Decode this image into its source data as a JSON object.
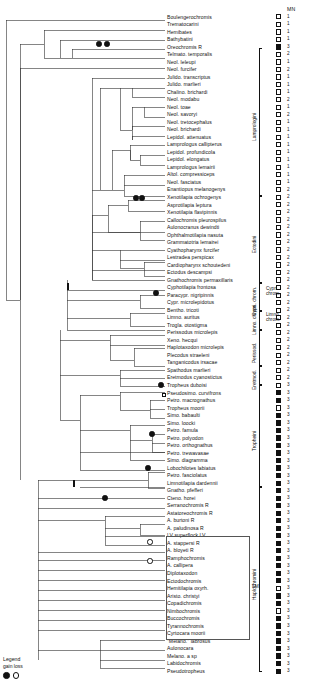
{
  "figure": {
    "title": "",
    "mn_header": "MN",
    "legend": {
      "title": "Legend",
      "subtitle": "gain loss",
      "symbols": [
        "gain-filled-circle",
        "loss-open-circle"
      ]
    },
    "lm_note": "LM"
  },
  "colors": {
    "line": "#111111",
    "fill_state": "#111111",
    "empty_state": "#ffffff",
    "box_outline": "#555555",
    "background": "#ffffff"
  },
  "group_brackets": [
    {
      "label": "Lamprologini",
      "top": 48,
      "bottom": 196
    },
    {
      "label": "Ectodini",
      "top": 196,
      "bottom": 283
    },
    {
      "label": "Cypri. chrom.",
      "top": 283,
      "bottom": 311
    },
    {
      "label": "Limno. chrom.",
      "top": 311,
      "bottom": 330
    },
    {
      "label": "Perissod.",
      "top": 330,
      "bottom": 366
    },
    {
      "label": "Eretmod.",
      "top": 366,
      "bottom": 385
    },
    {
      "label": "Tropheini",
      "top": 385,
      "bottom": 487
    },
    {
      "label": "Haplochromini",
      "top": 487,
      "bottom": 672
    }
  ],
  "taxa": [
    {
      "name": "Boulengerochromis",
      "state": "open",
      "code": "1"
    },
    {
      "name": "Trematocarini",
      "state": "open",
      "code": "1"
    },
    {
      "name": "Hemibates",
      "state": "open",
      "code": "1"
    },
    {
      "name": "Bathybatini",
      "state": "open",
      "code": "1"
    },
    {
      "name": "Oreochromis R",
      "state": "filled",
      "code": "3"
    },
    {
      "name": "Telmato. temporalis",
      "state": "open",
      "code": "2"
    },
    {
      "name": "Neol. leleupi",
      "state": "open",
      "code": "1"
    },
    {
      "name": "Neol. furcifer",
      "state": "open",
      "code": "2"
    },
    {
      "name": "Julido. transcriptus",
      "state": "open",
      "code": "1"
    },
    {
      "name": "Julido. marlieri",
      "state": "open",
      "code": "1"
    },
    {
      "name": "Chalino. brichardi",
      "state": "open",
      "code": "1"
    },
    {
      "name": "Neol. modabu",
      "state": "open",
      "code": "2"
    },
    {
      "name": "Neol. toae",
      "state": "open",
      "code": "1"
    },
    {
      "name": "Neol. savoryi",
      "state": "open",
      "code": "2"
    },
    {
      "name": "Neol. tretocephalus",
      "state": "open",
      "code": "1"
    },
    {
      "name": "Neol. brichardi",
      "state": "open",
      "code": "1"
    },
    {
      "name": "Lepidol. attenuatus",
      "state": "open",
      "code": "1"
    },
    {
      "name": "Lamprologus callipterus",
      "state": "open",
      "code": "1"
    },
    {
      "name": "Lepidol. profundicola",
      "state": "open",
      "code": "1"
    },
    {
      "name": "Lepidol. elongatus",
      "state": "open",
      "code": "1"
    },
    {
      "name": "Lamprologus lemairii",
      "state": "open",
      "code": "1"
    },
    {
      "name": "Altol. compressiceps",
      "state": "open",
      "code": "1"
    },
    {
      "name": "Neol. fasciatus",
      "state": "open",
      "code": "1"
    },
    {
      "name": "Enantiopus melanogenys",
      "state": "open",
      "code": "2"
    },
    {
      "name": "Xenotilapia ochrogenys",
      "state": "open",
      "code": "2"
    },
    {
      "name": "Asprotilapia leptura",
      "state": "open",
      "code": "2"
    },
    {
      "name": "Xenotilapia flavipinnis",
      "state": "open",
      "code": "2"
    },
    {
      "name": "Callochromis pleurospilus",
      "state": "open",
      "code": "2"
    },
    {
      "name": "Aulonocranus dewindti",
      "state": "open",
      "code": "2"
    },
    {
      "name": "Ophthalmotilapia nasuta",
      "state": "open",
      "code": "2"
    },
    {
      "name": "Grammatotria lemairei",
      "state": "open",
      "code": "2"
    },
    {
      "name": "Cyathopharynx furcifer",
      "state": "open",
      "code": "2"
    },
    {
      "name": "Lestradea perspicax",
      "state": "open",
      "code": "2"
    },
    {
      "name": "Cardiopharynx schoutedeni",
      "state": "open",
      "code": "2"
    },
    {
      "name": "Ectodus descampsi",
      "state": "open",
      "code": "2"
    },
    {
      "name": "Gnathochromis permaxillaris",
      "state": "open",
      "code": "2"
    },
    {
      "name": "Cyphotilapia frontosa",
      "state": "open",
      "code": "2"
    },
    {
      "name": "Paracypr. nigripinnis",
      "state": "open",
      "code": "2"
    },
    {
      "name": "Cypr. microlepidotus",
      "state": "open",
      "code": "2"
    },
    {
      "name": "Bentho. tricoti",
      "state": "open",
      "code": "2"
    },
    {
      "name": "Limno. auritus",
      "state": "open",
      "code": "2"
    },
    {
      "name": "Trogla. otostigma",
      "state": "open",
      "code": "2"
    },
    {
      "name": "Perissodus microlepis",
      "state": "open",
      "code": "2"
    },
    {
      "name": "Xeno. hecqui",
      "state": "open",
      "code": "2"
    },
    {
      "name": "Haplotaxodon microlepis",
      "state": "open",
      "code": "2"
    },
    {
      "name": "Plecodus straeleni",
      "state": "open",
      "code": "2"
    },
    {
      "name": "Tanganicodus irsacae",
      "state": "open",
      "code": "2"
    },
    {
      "name": "Spathodus marlieri",
      "state": "open",
      "code": "2"
    },
    {
      "name": "Eretmodus cyanostictus",
      "state": "open",
      "code": "2"
    },
    {
      "name": "Tropheus duboisi",
      "state": "open",
      "code": "3"
    },
    {
      "name": "Pseudosimo. curvifrons",
      "state": "filled",
      "code": "3"
    },
    {
      "name": "Petro. macrognathus",
      "state": "filled",
      "code": "3"
    },
    {
      "name": "Tropheus moorii",
      "state": "open",
      "code": "3"
    },
    {
      "name": "Simo. babaulti",
      "state": "filled",
      "code": "3"
    },
    {
      "name": "Simo. loocki",
      "state": "filled",
      "code": "3"
    },
    {
      "name": "Petro. famula",
      "state": "filled",
      "code": "3"
    },
    {
      "name": "Petro. polyodon",
      "state": "filled",
      "code": "3"
    },
    {
      "name": "Petro. orthognathus",
      "state": "filled",
      "code": "3"
    },
    {
      "name": "Petro. trewavasae",
      "state": "filled",
      "code": "3"
    },
    {
      "name": "Simo. diagramma",
      "state": "filled",
      "code": "3"
    },
    {
      "name": "Lobochilotes labiatus",
      "state": "filled",
      "code": "3"
    },
    {
      "name": "Petro. fasciolatus",
      "state": "filled",
      "code": "3"
    },
    {
      "name": "Limnotilapia dardennii",
      "state": "filled",
      "code": "3"
    },
    {
      "name": "Gnatho. pfefferi",
      "state": "filled",
      "code": "3"
    },
    {
      "name": "Cteno. horei",
      "state": "filled",
      "code": "3"
    },
    {
      "name": "Serranochromis R",
      "state": "filled",
      "code": "3"
    },
    {
      "name": "Astatoreochromis R",
      "state": "filled",
      "code": "3"
    },
    {
      "name": "A. burtoni R",
      "state": "filled",
      "code": "3"
    },
    {
      "name": "A. paludinosa R",
      "state": "filled",
      "code": "3"
    },
    {
      "name": "LV superflock LV",
      "state": "filled",
      "code": "3"
    },
    {
      "name": "A. stappersi R",
      "state": "filled",
      "code": "3"
    },
    {
      "name": "A. bloyeti R",
      "state": "filled",
      "code": "3"
    },
    {
      "name": "Ramphochromis",
      "state": "filled",
      "code": "3"
    },
    {
      "name": "A. callipera",
      "state": "filled",
      "code": "3"
    },
    {
      "name": "Diplotaxodon",
      "state": "filled",
      "code": "3"
    },
    {
      "name": "Ectodochromis",
      "state": "filled",
      "code": "3"
    },
    {
      "name": "Hemitilapia oxyrh.",
      "state": "open",
      "code": "3"
    },
    {
      "name": "Aristo. christyi",
      "state": "filled",
      "code": "3"
    },
    {
      "name": "Copadichromis",
      "state": "filled",
      "code": "3"
    },
    {
      "name": "Nimbochromis",
      "state": "open",
      "code": "3"
    },
    {
      "name": "Buccochromis",
      "state": "filled",
      "code": "3"
    },
    {
      "name": "Tyrannochromis",
      "state": "filled",
      "code": "3"
    },
    {
      "name": "Cyrtocara moorii",
      "state": "filled",
      "code": "3"
    },
    {
      "name": "\"Melano.\" labrosus",
      "state": "filled",
      "code": "3"
    },
    {
      "name": "Aulonocara",
      "state": "filled",
      "code": "3"
    },
    {
      "name": "Melano. a sp",
      "state": "filled",
      "code": "3"
    },
    {
      "name": "Labidochromis",
      "state": "filled",
      "code": "3"
    },
    {
      "name": "Pseudotropheus",
      "state": "filled",
      "code": "3"
    }
  ],
  "node_markers": [
    {
      "type": "gain",
      "x": 99,
      "y": 44
    },
    {
      "type": "gain",
      "x": 107,
      "y": 44
    },
    {
      "type": "gain",
      "x": 136,
      "y": 198
    },
    {
      "type": "gain",
      "x": 142,
      "y": 198
    },
    {
      "type": "bar",
      "x": 67,
      "y": 286
    },
    {
      "type": "gain",
      "x": 156,
      "y": 293
    },
    {
      "type": "gain",
      "x": 161,
      "y": 385
    },
    {
      "type": "square",
      "x": 164,
      "y": 395
    },
    {
      "type": "gain",
      "x": 152,
      "y": 434
    },
    {
      "type": "gain",
      "x": 148,
      "y": 468
    },
    {
      "type": "bar",
      "x": 73,
      "y": 483
    },
    {
      "type": "gain",
      "x": 105,
      "y": 498
    },
    {
      "type": "loss",
      "x": 150,
      "y": 542
    },
    {
      "type": "loss",
      "x": 150,
      "y": 561
    }
  ]
}
